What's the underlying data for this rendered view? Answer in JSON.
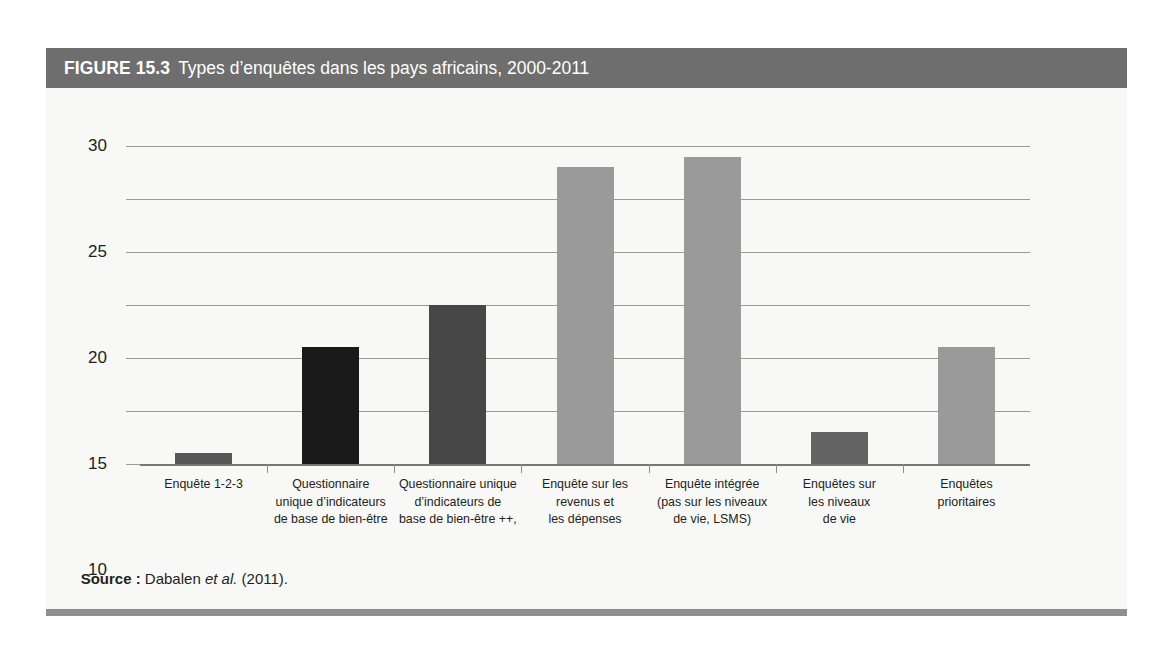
{
  "figure": {
    "number": "FIGURE 15.3",
    "title": "Types d’enquêtes dans les pays africains, 2000-2011",
    "header_bg": "#6e6e6e",
    "panel_bg": "#f8f8f7"
  },
  "source": {
    "label": "Source :",
    "author": " Dabalen ",
    "italic": "et al.",
    "year": " (2011)."
  },
  "chart_data": {
    "type": "bar",
    "title": "Types d’enquêtes dans les pays africains, 2000-2011",
    "xlabel": "",
    "ylabel": "",
    "ylim": [
      0,
      30
    ],
    "yticks": [
      0,
      5,
      10,
      15,
      20,
      25,
      30
    ],
    "ytick_labels": [
      "0",
      "5",
      "10",
      "15",
      "20",
      "25",
      "30"
    ],
    "grid": true,
    "legend": "none",
    "categories": [
      "Enquête 1-2-3",
      "Questionnaire unique d’indicateurs de base de bien-être",
      "Questionnaire unique d’indicateurs de base de bien-être ++,",
      "Enquête sur les revenus et les dépenses",
      "Enquête intégrée (pas sur les niveaux de vie, LSMS)",
      "Enquêtes sur les niveaux de vie",
      "Enquêtes prioritaires"
    ],
    "category_lines": [
      [
        "Enquête 1-2-3"
      ],
      [
        "Questionnaire",
        "unique d’indicateurs",
        "de base de bien-être"
      ],
      [
        "Questionnaire unique",
        "d’indicateurs de",
        "base de bien-être ++,"
      ],
      [
        "Enquête sur les",
        "revenus et",
        "les dépenses"
      ],
      [
        "Enquête intégrée",
        "(pas sur les niveaux",
        "de vie, LSMS)"
      ],
      [
        "Enquêtes sur",
        "les niveaux",
        "de vie"
      ],
      [
        "Enquêtes",
        "prioritaires"
      ]
    ],
    "values": [
      1,
      11,
      15,
      28,
      29,
      3,
      11
    ],
    "bar_colors": [
      "#585858",
      "#1a1a1a",
      "#474747",
      "#9a9a9a",
      "#9a9a9a",
      "#636363",
      "#9a9a9a"
    ]
  }
}
